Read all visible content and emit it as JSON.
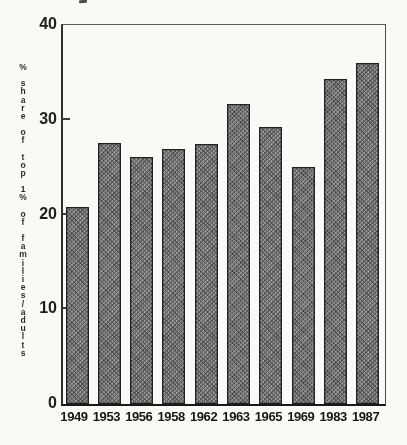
{
  "chart_data": {
    "type": "bar",
    "categories": [
      "1949",
      "1953",
      "1956",
      "1958",
      "1962",
      "1963",
      "1965",
      "1969",
      "1983",
      "1987"
    ],
    "values": [
      20.8,
      27.5,
      26.1,
      26.9,
      27.4,
      31.7,
      29.2,
      25.0,
      34.3,
      36.0
    ],
    "title": "",
    "xlabel": "",
    "ylabel": "% share of top 1% of families/adults",
    "ylabel_words": [
      "%",
      "share",
      "of",
      "top",
      "1%",
      "of",
      "families/adults"
    ],
    "ylim": [
      0,
      40
    ],
    "yticks": [
      0,
      10,
      20,
      30,
      40
    ],
    "inner_tick_values": [
      10,
      20,
      30
    ],
    "grid": false,
    "legend": "none",
    "bar_fill_color": "#7e7e7e",
    "bar_border_color": "#1f1f1f",
    "axis_color": "#2e2e2e",
    "background_color": "#fcfbf8"
  }
}
